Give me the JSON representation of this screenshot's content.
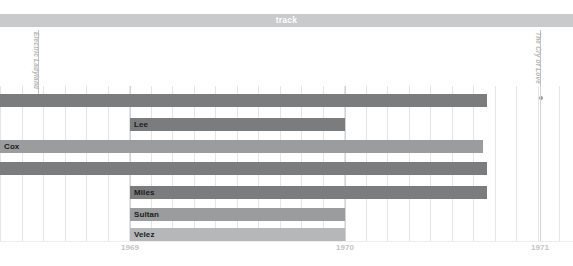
{
  "banner": {
    "label": "track",
    "color": "#c9cacb"
  },
  "events": [
    {
      "label": "Electric Ladyland",
      "x": 38
    },
    {
      "label": "The Cry of Love",
      "x": 540
    }
  ],
  "axis": {
    "ticks": [
      {
        "label": "1969",
        "x": 130
      },
      {
        "label": "1970",
        "x": 345
      },
      {
        "label": "1971",
        "x": 540
      }
    ],
    "major_gridlines": [
      130,
      345,
      540
    ],
    "minor_gridline_step": 21.5
  },
  "chart_data": {
    "type": "bar",
    "title": "track",
    "xlabel": "",
    "ylabel": "",
    "orientation": "horizontal",
    "x_axis_ticks": [
      "1969",
      "1970",
      "1971"
    ],
    "grid": true,
    "legend": "none",
    "annotations": [
      "Electric Ladyland",
      "The Cry of Love"
    ],
    "colors": {
      "dark": "#7b7c7d",
      "mid": "#9b9c9d",
      "light": "#b6b7b8"
    },
    "bars": [
      {
        "name": "",
        "label": "",
        "start": 0,
        "end": 487,
        "row": 0,
        "color": "#7b7c7d"
      },
      {
        "name": "Lee",
        "label": "Lee",
        "start": 130,
        "end": 345,
        "row": 1,
        "color": "#7b7c7d"
      },
      {
        "name": "Cox",
        "label": "Cox",
        "start": 0,
        "end": 483,
        "row": 2,
        "color": "#9b9c9d"
      },
      {
        "name": "",
        "label": "",
        "start": 0,
        "end": 487,
        "row": 3,
        "color": "#7b7c7d"
      },
      {
        "name": "Miles",
        "label": "Miles",
        "start": 130,
        "end": 487,
        "row": 4,
        "color": "#7b7c7d"
      },
      {
        "name": "Sultan",
        "label": "Sultan",
        "start": 130,
        "end": 345,
        "row": 5,
        "color": "#9b9c9d"
      },
      {
        "name": "Velez",
        "label": "Velez",
        "start": 130,
        "end": 345,
        "row": 6,
        "color": "#b6b7b8"
      }
    ],
    "row_tops": [
      8,
      32,
      54,
      76,
      100,
      122,
      142
    ]
  }
}
